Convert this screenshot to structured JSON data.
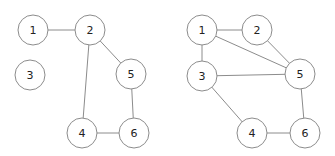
{
  "graphs": [
    {
      "name": "left-graph",
      "nodes": [
        {
          "id": "1",
          "label": "1",
          "x": 33,
          "y": 30
        },
        {
          "id": "2",
          "label": "2",
          "x": 90,
          "y": 30
        },
        {
          "id": "3",
          "label": "3",
          "x": 30,
          "y": 75
        },
        {
          "id": "5",
          "label": "5",
          "x": 131,
          "y": 74
        },
        {
          "id": "4",
          "label": "4",
          "x": 82,
          "y": 133
        },
        {
          "id": "6",
          "label": "6",
          "x": 134,
          "y": 133
        }
      ],
      "edges": [
        [
          "1",
          "2"
        ],
        [
          "2",
          "5"
        ],
        [
          "2",
          "4"
        ],
        [
          "5",
          "6"
        ],
        [
          "4",
          "6"
        ]
      ]
    },
    {
      "name": "right-graph",
      "nodes": [
        {
          "id": "1",
          "label": "1",
          "x": 202,
          "y": 30
        },
        {
          "id": "2",
          "label": "2",
          "x": 257,
          "y": 30
        },
        {
          "id": "3",
          "label": "3",
          "x": 202,
          "y": 76
        },
        {
          "id": "5",
          "label": "5",
          "x": 300,
          "y": 74
        },
        {
          "id": "4",
          "label": "4",
          "x": 252,
          "y": 133
        },
        {
          "id": "6",
          "label": "6",
          "x": 305,
          "y": 133
        }
      ],
      "edges": [
        [
          "1",
          "2"
        ],
        [
          "1",
          "5"
        ],
        [
          "1",
          "3"
        ],
        [
          "2",
          "5"
        ],
        [
          "3",
          "5"
        ],
        [
          "3",
          "4"
        ],
        [
          "5",
          "6"
        ],
        [
          "4",
          "6"
        ]
      ]
    }
  ],
  "style": {
    "node_radius": 15,
    "stroke": "#8c8c8c"
  }
}
